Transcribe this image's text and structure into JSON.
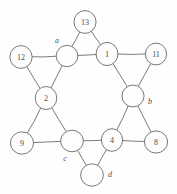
{
  "figure": {
    "type": "hexagram-graph-diagram",
    "background_color": "#fefefe",
    "line_color": "#6b6b6b",
    "text_color": "#4a4a4a",
    "width": 177,
    "height": 194
  },
  "chart_data": {
    "type": "diagram",
    "title": "",
    "nodes": [
      {
        "id": "n13",
        "label": "13",
        "x": 85,
        "y": 22,
        "r": 11,
        "label_position": "inside",
        "group": "outer-point"
      },
      {
        "id": "na",
        "label": "a",
        "x": 67,
        "y": 56,
        "r": 11,
        "label_position": "outside-top-left",
        "label_x": 57,
        "label_y": 40,
        "group": "inner-hexagon"
      },
      {
        "id": "n1",
        "label": "1",
        "x": 107,
        "y": 54,
        "r": 11,
        "label_position": "inside",
        "group": "inner-hexagon"
      },
      {
        "id": "n12",
        "label": "12",
        "x": 21,
        "y": 57,
        "r": 11,
        "label_position": "inside",
        "group": "outer-point"
      },
      {
        "id": "n11",
        "label": "11",
        "x": 156,
        "y": 54,
        "r": 11,
        "label_position": "inside",
        "group": "outer-point"
      },
      {
        "id": "n2",
        "label": "2",
        "x": 46,
        "y": 98,
        "r": 11,
        "label_position": "inside",
        "group": "inner-hexagon"
      },
      {
        "id": "nb",
        "label": "b",
        "x": 133,
        "y": 96,
        "r": 11,
        "label_position": "outside-right",
        "label_x": 150,
        "label_y": 101,
        "group": "inner-hexagon"
      },
      {
        "id": "n9",
        "label": "9",
        "x": 22,
        "y": 143,
        "r": 11,
        "label_position": "inside",
        "group": "outer-point"
      },
      {
        "id": "nc",
        "label": "c",
        "x": 72,
        "y": 141,
        "r": 11,
        "label_position": "outside-bottom-left",
        "label_x": 65,
        "label_y": 158,
        "group": "inner-hexagon"
      },
      {
        "id": "n4",
        "label": "4",
        "x": 112,
        "y": 140,
        "r": 11,
        "label_position": "inside",
        "group": "inner-hexagon"
      },
      {
        "id": "n8",
        "label": "8",
        "x": 156,
        "y": 142,
        "r": 11,
        "label_position": "inside",
        "group": "outer-point"
      },
      {
        "id": "nd",
        "label": "d",
        "x": 92,
        "y": 175,
        "r": 11,
        "label_position": "outside-right",
        "label_x": 110,
        "label_y": 174,
        "group": "outer-point"
      }
    ],
    "edges": [
      {
        "from": "n13",
        "to": "na"
      },
      {
        "from": "n13",
        "to": "n1"
      },
      {
        "from": "na",
        "to": "n1"
      },
      {
        "from": "n12",
        "to": "na"
      },
      {
        "from": "n12",
        "to": "n2"
      },
      {
        "from": "na",
        "to": "n2"
      },
      {
        "from": "n1",
        "to": "n11"
      },
      {
        "from": "n11",
        "to": "nb"
      },
      {
        "from": "n1",
        "to": "nb"
      },
      {
        "from": "n2",
        "to": "n9"
      },
      {
        "from": "n9",
        "to": "nc"
      },
      {
        "from": "n2",
        "to": "nc"
      },
      {
        "from": "nb",
        "to": "n4"
      },
      {
        "from": "n4",
        "to": "n8"
      },
      {
        "from": "nb",
        "to": "n8"
      },
      {
        "from": "nc",
        "to": "n4"
      },
      {
        "from": "nc",
        "to": "nd"
      },
      {
        "from": "n4",
        "to": "nd"
      }
    ],
    "legend": [],
    "annotations": []
  }
}
